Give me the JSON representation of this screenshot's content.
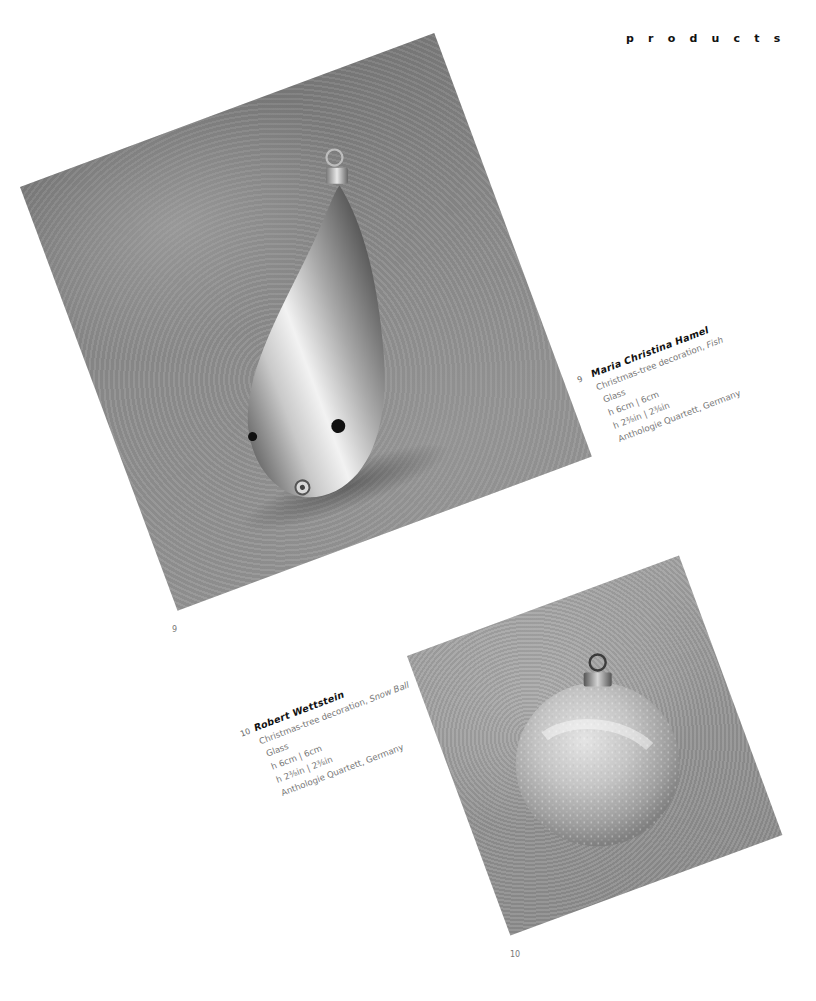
{
  "page": {
    "section_title": "products",
    "background_color": "#ffffff"
  },
  "items": [
    {
      "number": "9",
      "figure_label": "9",
      "designer": "Maria Christina Hamel",
      "description": "Christmas-tree decoration, ",
      "object_name": "Fish",
      "material": "Glass",
      "size_metric": "h 6cm  | 6cm",
      "size_imperial": "h 2⅜in  | 2⅜in",
      "manufacturer": "Anthologie Quartett, Germany",
      "image_subject": "silver-teardrop-fish-ornament-icon"
    },
    {
      "number": "10",
      "figure_label": "10",
      "designer": "Robert Wettstein",
      "description": "Christmas-tree decoration, ",
      "object_name": "Snow Ball",
      "material": "Glass",
      "size_metric": "h 6cm  | 6cm",
      "size_imperial": "h 2⅜in  | 2⅜in",
      "manufacturer": "Anthologie Quartett, Germany",
      "image_subject": "glitter-snow-ball-ornament-icon"
    }
  ]
}
